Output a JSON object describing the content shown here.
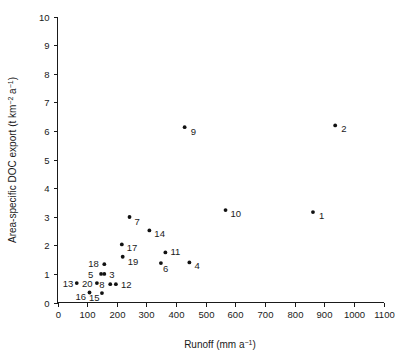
{
  "chart_data": {
    "type": "scatter",
    "title": "",
    "xlabel": "Runoff (mm a⁻¹)",
    "ylabel": "Area-specific DOC export (t km⁻² a⁻¹)",
    "xlabel_parts": {
      "base": "Runoff (mm a",
      "exp": "−1",
      "tail": ")"
    },
    "ylabel_parts": {
      "base": "Area-specific DOC export (t km",
      "exp1": "−2",
      "mid": " a",
      "exp2": "−1",
      "tail": ")"
    },
    "xlim": [
      0,
      1100
    ],
    "ylim": [
      0,
      10
    ],
    "xticks": [
      0,
      100,
      200,
      300,
      400,
      500,
      600,
      700,
      800,
      900,
      1000,
      1100
    ],
    "yticks": [
      0,
      1,
      2,
      3,
      4,
      5,
      6,
      7,
      8,
      9,
      10
    ],
    "xtick_labels": [
      "0",
      "100",
      "200",
      "300",
      "400",
      "500",
      "600",
      "700",
      "800",
      "900",
      "1000",
      "1100"
    ],
    "ytick_labels": [
      "0",
      "1",
      "2",
      "3",
      "4",
      "5",
      "6",
      "7",
      "8",
      "9",
      "10"
    ],
    "grid": false,
    "legend": null,
    "marker_color": "#111111",
    "axis_color": "#1a1a1a",
    "points": [
      {
        "label": "1",
        "x": 862,
        "y": 3.16,
        "lx": 6,
        "ly": 7
      },
      {
        "label": "2",
        "x": 937,
        "y": 6.19,
        "lx": 6,
        "ly": 7
      },
      {
        "label": "3",
        "x": 158,
        "y": 1.0,
        "lx": 5,
        "ly": 4
      },
      {
        "label": "4",
        "x": 445,
        "y": 1.4,
        "lx": 5,
        "ly": 7
      },
      {
        "label": "5",
        "x": 147,
        "y": 1.0,
        "lx": -13,
        "ly": 4
      },
      {
        "label": "6",
        "x": 349,
        "y": 1.38,
        "lx": 2,
        "ly": 9
      },
      {
        "label": "7",
        "x": 243,
        "y": 2.99,
        "lx": 5,
        "ly": 8
      },
      {
        "label": "8",
        "x": 178,
        "y": 0.64,
        "lx": -11,
        "ly": 4
      },
      {
        "label": "9",
        "x": 429,
        "y": 6.13,
        "lx": 6,
        "ly": 8
      },
      {
        "label": "10",
        "x": 567,
        "y": 3.23,
        "lx": 5,
        "ly": 7
      },
      {
        "label": "11",
        "x": 364,
        "y": 1.75,
        "lx": 5,
        "ly": 3
      },
      {
        "label": "12",
        "x": 197,
        "y": 0.64,
        "lx": 5,
        "ly": 4
      },
      {
        "label": "13",
        "x": 65,
        "y": 0.68,
        "lx": -14,
        "ly": 4
      },
      {
        "label": "14",
        "x": 310,
        "y": 2.52,
        "lx": 5,
        "ly": 7
      },
      {
        "label": "15",
        "x": 150,
        "y": 0.33,
        "lx": -13,
        "ly": 8
      },
      {
        "label": "16",
        "x": 108,
        "y": 0.35,
        "lx": -14,
        "ly": 8
      },
      {
        "label": "17",
        "x": 217,
        "y": 2.03,
        "lx": 5,
        "ly": 7
      },
      {
        "label": "18",
        "x": 158,
        "y": 1.34,
        "lx": -16,
        "ly": 3
      },
      {
        "label": "19",
        "x": 220,
        "y": 1.6,
        "lx": 5,
        "ly": 8
      },
      {
        "label": "20",
        "x": 133,
        "y": 0.68,
        "lx": -15,
        "ly": 4
      }
    ]
  }
}
